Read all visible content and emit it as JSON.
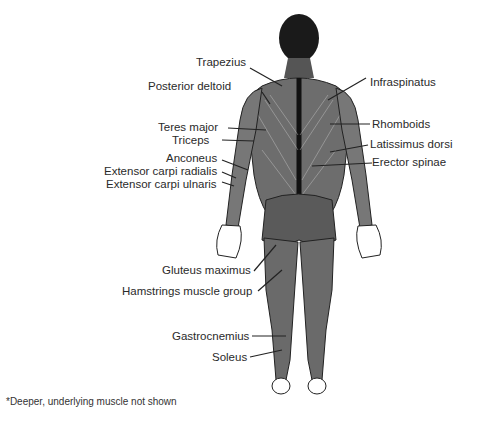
{
  "diagram": {
    "left_labels": [
      {
        "id": "trapezius",
        "text": "Trapezius"
      },
      {
        "id": "posterior_deltoid",
        "text": "Posterior deltoid"
      },
      {
        "id": "teres_major",
        "text": "Teres major"
      },
      {
        "id": "triceps",
        "text": "Triceps"
      },
      {
        "id": "anconeus",
        "text": "Anconeus"
      },
      {
        "id": "ext_carpi_radialis",
        "text": "Extensor carpi radialis"
      },
      {
        "id": "ext_carpi_ulnaris",
        "text": "Extensor carpi ulnaris"
      },
      {
        "id": "gluteus_maximus",
        "text": "Gluteus maximus"
      },
      {
        "id": "hamstrings",
        "text": "Hamstrings muscle group"
      },
      {
        "id": "gastrocnemius",
        "text": "Gastrocnemius"
      },
      {
        "id": "soleus",
        "text": "Soleus"
      }
    ],
    "right_labels": [
      {
        "id": "infraspinatus",
        "text": "Infraspinatus"
      },
      {
        "id": "rhomboids",
        "text": "Rhomboids"
      },
      {
        "id": "latissimus_dorsi",
        "text": "Latissimus dorsi"
      },
      {
        "id": "erector_spinae",
        "text": "Erector spinae"
      }
    ],
    "footnote": "*Deeper, underlying muscle not shown"
  }
}
